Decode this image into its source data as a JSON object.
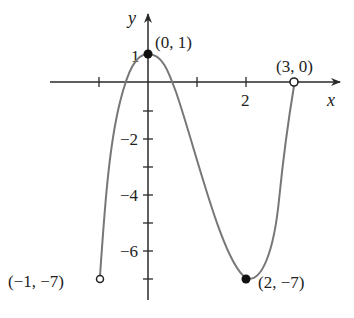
{
  "figure": {
    "axes": {
      "x_label": "x",
      "y_label": "y",
      "x_tick_labels": [
        {
          "value": 2,
          "text": "2"
        }
      ],
      "y_tick_labels": [
        {
          "value": 1,
          "text": "1"
        },
        {
          "value": -2,
          "text": "−2"
        },
        {
          "value": -4,
          "text": "−4"
        },
        {
          "value": -6,
          "text": "−6"
        }
      ]
    },
    "points": [
      {
        "label": "(0, 1)",
        "x": 0,
        "y": 1,
        "style": "closed"
      },
      {
        "label": "(3, 0)",
        "x": 3,
        "y": 0,
        "style": "open"
      },
      {
        "label": "(−1, −7)",
        "x": -1,
        "y": -7,
        "style": "open"
      },
      {
        "label": "(2, −7)",
        "x": 2,
        "y": -7,
        "style": "closed"
      }
    ],
    "colors": {
      "axis": "#2a2a2a",
      "curve": "#777777",
      "text": "#222222"
    }
  }
}
